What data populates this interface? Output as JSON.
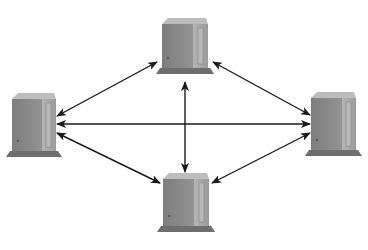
{
  "diagram": {
    "type": "network-topology",
    "colors": {
      "background": "#ffffff",
      "arrow": "#1a1a1a",
      "server_front": "#8a8a8a",
      "server_side": "#a9a9a9",
      "server_top": "#bdbdbd",
      "server_base": "#6e6e6e",
      "server_slot": "#9c9c9c"
    },
    "nodes": [
      {
        "id": "server-top",
        "label": "",
        "x": 162,
        "y": 18,
        "w": 46,
        "h": 50
      },
      {
        "id": "server-left",
        "label": "",
        "x": 12,
        "y": 93,
        "w": 44,
        "h": 58
      },
      {
        "id": "server-right",
        "label": "",
        "x": 311,
        "y": 92,
        "w": 45,
        "h": 58
      },
      {
        "id": "server-bottom",
        "label": "",
        "x": 163,
        "y": 173,
        "w": 46,
        "h": 53
      }
    ],
    "edges": [
      {
        "from": "server-top",
        "to": "server-left",
        "x1": 157,
        "y1": 62,
        "x2": 57,
        "y2": 116,
        "bidirectional": true
      },
      {
        "from": "server-top",
        "to": "server-right",
        "x1": 213,
        "y1": 62,
        "x2": 310,
        "y2": 115,
        "bidirectional": true
      },
      {
        "from": "server-top",
        "to": "server-bottom",
        "x1": 185,
        "y1": 82,
        "x2": 185,
        "y2": 172,
        "bidirectional": true
      },
      {
        "from": "server-left",
        "to": "server-right",
        "x1": 57,
        "y1": 124,
        "x2": 310,
        "y2": 124,
        "bidirectional": true
      },
      {
        "from": "server-left",
        "to": "server-bottom",
        "x1": 57,
        "y1": 133,
        "x2": 160,
        "y2": 183,
        "bidirectional": true
      },
      {
        "from": "server-right",
        "to": "server-bottom",
        "x1": 310,
        "y1": 133,
        "x2": 212,
        "y2": 183,
        "bidirectional": true
      }
    ]
  }
}
